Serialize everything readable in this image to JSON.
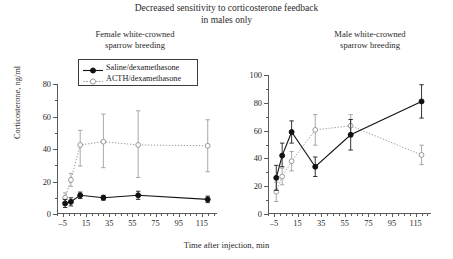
{
  "figure": {
    "title_line1": "Decreased sensitivity to corticosterone feedback",
    "title_line2": "in males only",
    "xlabel": "Time after injection, min",
    "ylabel": "Corticosterone, ng/ml"
  },
  "legend": {
    "position": "upper-left-of-left-panel",
    "entries": [
      {
        "label": "Saline/dexamethasone",
        "marker": "filled-circle",
        "line": "solid",
        "color": "#111111"
      },
      {
        "label": "ACTH/dexamethasone",
        "marker": "open-circle",
        "line": "dotted",
        "color": "#9a9a9a"
      }
    ]
  },
  "chart_data": [
    {
      "type": "line",
      "panel": "left",
      "title": "Female white-crowned sparrow breeding",
      "xlabel": "Time after injection, min",
      "ylabel": "Corticosterone, ng/ml",
      "xlim": [
        -10,
        128
      ],
      "ylim": [
        0,
        80
      ],
      "yticks": [
        0,
        20,
        40,
        60,
        80
      ],
      "xticks": [
        -5,
        15,
        35,
        55,
        75,
        95,
        115
      ],
      "grid": false,
      "x": [
        -3,
        2,
        10,
        30,
        60,
        120
      ],
      "series": [
        {
          "name": "Saline/dexamethasone",
          "marker": "filled-circle",
          "line": "solid",
          "color": "#111111",
          "values": [
            6.5,
            7.5,
            11.5,
            10.0,
            11.5,
            9.0
          ],
          "err_low": [
            2.5,
            2.5,
            2.0,
            1.5,
            2.5,
            2.0
          ],
          "err_high": [
            2.5,
            2.5,
            2.0,
            1.5,
            2.5,
            2.0
          ]
        },
        {
          "name": "ACTH/dexamethasone",
          "marker": "open-circle",
          "line": "dotted",
          "color": "#9a9a9a",
          "values": [
            10.0,
            21.0,
            42.5,
            44.5,
            42.5,
            42.0
          ],
          "err_low": [
            3.0,
            4.0,
            13.0,
            16.0,
            20.0,
            16.0
          ],
          "err_high": [
            3.0,
            4.0,
            9.0,
            17.0,
            21.0,
            16.0
          ]
        }
      ]
    },
    {
      "type": "line",
      "panel": "right",
      "title": "Male white-crowned sparrow breeding",
      "xlabel": "Time after injection, min",
      "ylabel": "Corticosterone, ng/ml",
      "xlim": [
        -10,
        128
      ],
      "ylim": [
        0,
        100
      ],
      "yticks": [
        0,
        20,
        40,
        60,
        80,
        100
      ],
      "xticks": [
        -5,
        15,
        35,
        55,
        75,
        95,
        115
      ],
      "grid": false,
      "x": [
        -3,
        2,
        10,
        30,
        60,
        120
      ],
      "series": [
        {
          "name": "Saline/dexamethasone",
          "marker": "filled-circle",
          "line": "solid",
          "color": "#111111",
          "values": [
            26.0,
            42.0,
            59.0,
            34.0,
            57.0,
            81.0
          ],
          "err_low": [
            9.0,
            8.0,
            8.0,
            7.0,
            11.0,
            12.0
          ],
          "err_high": [
            9.0,
            9.0,
            8.0,
            7.0,
            11.0,
            12.0
          ]
        },
        {
          "name": "ACTH/dexamethasone",
          "marker": "open-circle",
          "line": "dotted",
          "color": "#9a9a9a",
          "values": [
            16.0,
            27.0,
            38.0,
            60.5,
            63.5,
            42.5
          ],
          "err_low": [
            7.0,
            6.0,
            7.0,
            11.0,
            8.0,
            7.0
          ],
          "err_high": [
            7.0,
            6.0,
            7.0,
            11.0,
            8.0,
            7.0
          ]
        }
      ]
    }
  ]
}
